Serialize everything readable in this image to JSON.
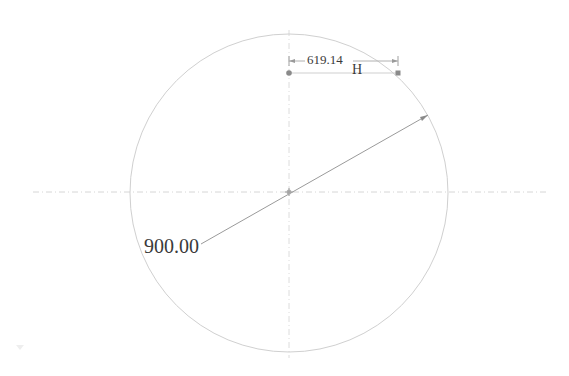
{
  "drawing": {
    "circle": {
      "cx": 289,
      "cy": 193,
      "r": 159,
      "stroke": "#d0d0d0"
    },
    "centerline_color": "#d6d6d6",
    "diameter_line": {
      "x1": 201,
      "y1": 244,
      "x2": 428,
      "y2": 115,
      "stroke": "#9a9a9a"
    },
    "diameter_label": "900.00",
    "horizontal_dimension": {
      "value": "619.14",
      "suffix": "H",
      "start_point": {
        "x": 289,
        "y": 73
      },
      "end_point": {
        "x": 398,
        "y": 73
      },
      "line_y": 61
    }
  }
}
